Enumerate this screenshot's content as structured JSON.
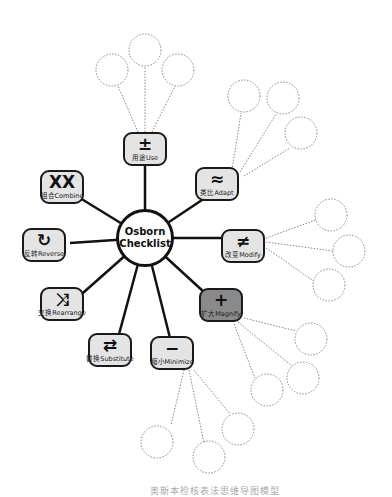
{
  "diagram": {
    "center": {
      "line1": "Osborn",
      "line2": "Checklist"
    },
    "nodes": [
      {
        "id": "use",
        "symbol": "±",
        "label": "用途Use",
        "fill": "#e4e4e4"
      },
      {
        "id": "adapt",
        "symbol": "≈",
        "label": "类比Adapt",
        "fill": "#e4e4e4"
      },
      {
        "id": "modify",
        "symbol": "≠",
        "label": "改变Modify",
        "fill": "#e4e4e4"
      },
      {
        "id": "magnify",
        "symbol": "+",
        "label": "扩大Magnify",
        "fill": "#8a8a8a"
      },
      {
        "id": "minimize",
        "symbol": "−",
        "label": "缩小Minimize",
        "fill": "#e4e4e4"
      },
      {
        "id": "substitute",
        "symbol": "⇄",
        "label": "替换Substitute",
        "fill": "#e4e4e4"
      },
      {
        "id": "rearrange",
        "symbol": "⤨",
        "label": "交换Rearrange",
        "fill": "#e4e4e4"
      },
      {
        "id": "reverse",
        "symbol": "↻",
        "label": "反转Reverse",
        "fill": "#e4e4e4"
      },
      {
        "id": "combine",
        "symbol": "XX",
        "label": "组合Combine",
        "fill": "#e4e4e4"
      }
    ],
    "caption": "奥斯本检核表法思维导图模型"
  }
}
